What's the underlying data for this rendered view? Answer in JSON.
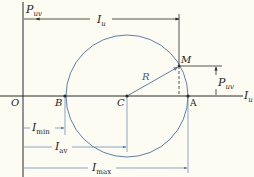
{
  "diagram": {
    "colors": {
      "background": "#fdfcf3",
      "axis": "#2a2a2a",
      "circle": "#5a7fb0",
      "dimension": "#6f8fb8",
      "text": "#222222"
    },
    "axes": {
      "vertical": {
        "symbol": "P",
        "subscript": "uv"
      },
      "horizontal": {
        "symbol": "I",
        "subscript": "u"
      },
      "origin": "O"
    },
    "points": {
      "O": "O",
      "B": "B",
      "C": "C",
      "A": "A",
      "M": "M"
    },
    "radius_label": "R",
    "dimensions": {
      "top_iu": {
        "symbol": "I",
        "subscript": "u"
      },
      "p_uv": {
        "symbol": "P",
        "subscript": "uv"
      },
      "i_min": {
        "symbol": "I",
        "subscript": "min"
      },
      "i_av": {
        "symbol": "I",
        "subscript": "av"
      },
      "i_max": {
        "symbol": "I",
        "subscript": "max"
      }
    }
  }
}
